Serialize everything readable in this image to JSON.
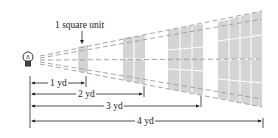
{
  "diagram": {
    "title_label": "1 square unit",
    "colors": {
      "panel": "#d4d4d4",
      "grid_line": "#ffffff",
      "dash": "#9a9a9a",
      "text": "#222222"
    },
    "source": {
      "icon": "light-bulb-icon",
      "x": 22,
      "y": 60
    },
    "panels": [
      {
        "distance_yd": 1,
        "grid": "1x1"
      },
      {
        "distance_yd": 2,
        "grid": "2x2"
      },
      {
        "distance_yd": 3,
        "grid": "3x3"
      },
      {
        "distance_yd": 4,
        "grid": "4x4"
      }
    ],
    "dimensions": [
      {
        "label": "1 yd"
      },
      {
        "label": "2 yd"
      },
      {
        "label": "3 yd"
      },
      {
        "label": "4 yd"
      }
    ]
  }
}
